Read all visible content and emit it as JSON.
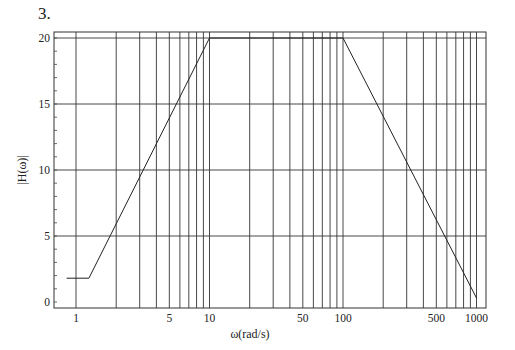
{
  "problem_number": "3.",
  "chart_data": {
    "type": "line",
    "title": "",
    "xlabel": "ω(rad/s)",
    "ylabel": "|H(ω)|",
    "xscale": "log",
    "xlim": [
      0.85,
      1100
    ],
    "ylim": [
      0,
      20.5
    ],
    "grid": true,
    "x_tick_labels": [
      "1",
      "5",
      "10",
      "50",
      "100",
      "500",
      "1000"
    ],
    "x_tick_values": [
      1,
      5,
      10,
      50,
      100,
      500,
      1000
    ],
    "y_tick_labels": [
      "0",
      "5",
      "10",
      "15",
      "20"
    ],
    "y_tick_values": [
      0,
      5,
      10,
      15,
      20
    ],
    "x_gridlines": [
      1,
      2,
      3,
      4,
      5,
      6,
      7,
      8,
      9,
      10,
      20,
      30,
      40,
      50,
      60,
      70,
      80,
      90,
      100,
      200,
      300,
      400,
      500,
      600,
      700,
      800,
      900,
      1000
    ],
    "y_gridlines": [
      5,
      10,
      15,
      20
    ],
    "y_minor_ticks_step": 1,
    "series": [
      {
        "name": "|H(ω)|",
        "x": [
          0.85,
          1.25,
          10,
          100,
          1000
        ],
        "y": [
          1.8,
          1.8,
          20,
          20,
          0.3
        ]
      }
    ],
    "legend": null
  }
}
